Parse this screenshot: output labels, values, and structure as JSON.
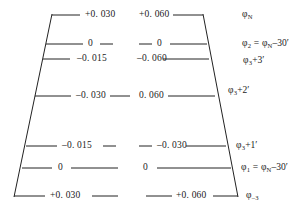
{
  "figure": {
    "type": "trapezoid-scale-diagram",
    "line_color": "#222222",
    "background": "#ffffff",
    "rows": [
      {
        "left_value": "+0. 030",
        "middle_value": "+0. 060",
        "right_label": "φ",
        "right_sub": "N",
        "right_tail": ""
      },
      {
        "left_value": "0",
        "middle_value": "0",
        "right_label": "φ",
        "right_sub": "2",
        "right_tail": " = φ"
      },
      {
        "left_value": "–0. 015",
        "middle_value": "–0. 060",
        "right_label": "φ",
        "right_sub": "3",
        "right_tail": "+3′"
      },
      {
        "left_value": "–0. 030",
        "middle_value": "0. 060",
        "right_label": "φ",
        "right_sub": "3",
        "right_tail": "+2′"
      },
      {
        "left_value": "–0. 015",
        "middle_value": "–0. 030",
        "right_label": "φ",
        "right_sub": "3",
        "right_tail": "+1′"
      },
      {
        "left_value": "0",
        "middle_value": "0",
        "right_label": "φ",
        "right_sub": "1",
        "right_tail": " = φ"
      },
      {
        "left_value": "+0. 030",
        "middle_value": "+0. 060",
        "right_label": "φ",
        "right_sub": "–3",
        "right_tail": ""
      }
    ],
    "right_labels_full": [
      "φN",
      "φ2 = φN–30′",
      "φ3+3′",
      "φ3+2′",
      "φ3+1′",
      "φ1 = φN–30′",
      "φ–3"
    ],
    "label_parts": {
      "row2": {
        "lead": "φ",
        "lead_sub": "2",
        "eq": " = ",
        "ref": "φ",
        "ref_sub": "N",
        "offset": "–30′"
      },
      "row6": {
        "lead": "φ",
        "lead_sub": "1",
        "eq": " = ",
        "ref": "φ",
        "ref_sub": "N",
        "offset": "–30′"
      },
      "row1": {
        "lead": "φ",
        "lead_sub": "N"
      },
      "row3": {
        "lead": "φ",
        "lead_sub": "3",
        "offset": "+3′"
      },
      "row4": {
        "lead": "φ",
        "lead_sub": "3",
        "offset": "+2′"
      },
      "row5": {
        "lead": "φ",
        "lead_sub": "3",
        "offset": "+1′"
      },
      "row7": {
        "lead": "φ",
        "lead_sub": "–3"
      }
    }
  }
}
